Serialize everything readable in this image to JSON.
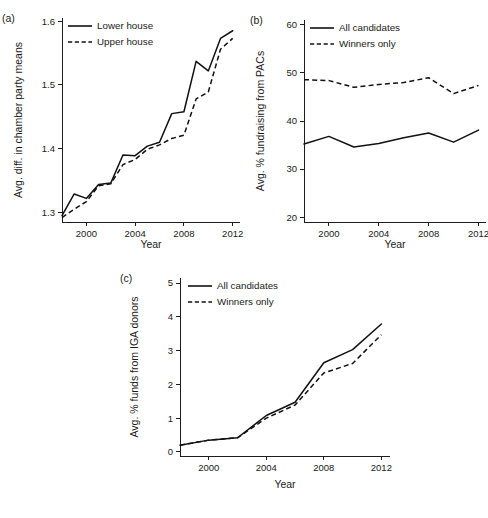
{
  "figure": {
    "background": "#ffffff",
    "line_color": "#111111",
    "axis_color": "#1d1d1d"
  },
  "chart_data": [
    {
      "type": "line",
      "panel": "(a)",
      "title": "",
      "xlabel": "Year",
      "ylabel": "Avg. diff. in chamber party means",
      "xlim": [
        1998,
        2012.6
      ],
      "ylim": [
        1.285,
        1.605
      ],
      "xticks": [
        2000,
        2004,
        2008,
        2012
      ],
      "yticks": [
        1.3,
        1.4,
        1.5,
        1.6
      ],
      "xticklabels": [
        "2000",
        "2004",
        "2008",
        "2012"
      ],
      "yticklabels": [
        "1.3",
        "1.4",
        "1.5",
        "1.6"
      ],
      "grid": false,
      "legend_position": "top-left",
      "x": [
        1998,
        1999,
        2000,
        2001,
        2002,
        2003,
        2004,
        2005,
        2006,
        2007,
        2008,
        2009,
        2010,
        2011,
        2012
      ],
      "series": [
        {
          "name": "Lower house",
          "style": "solid",
          "values": [
            1.295,
            1.329,
            1.322,
            1.344,
            1.346,
            1.39,
            1.389,
            1.404,
            1.41,
            1.455,
            1.458,
            1.537,
            1.522,
            1.573,
            1.585
          ]
        },
        {
          "name": "Upper house",
          "style": "dashed",
          "values": [
            1.292,
            1.305,
            1.317,
            1.342,
            1.345,
            1.375,
            1.383,
            1.399,
            1.406,
            1.416,
            1.421,
            1.478,
            1.489,
            1.556,
            1.573
          ]
        }
      ]
    },
    {
      "type": "line",
      "panel": "(b)",
      "title": "",
      "xlabel": "Year",
      "ylabel": "Avg. % fundraising from PACs",
      "xlim": [
        1998,
        2012.6
      ],
      "ylim": [
        19,
        61
      ],
      "xticks": [
        2000,
        2004,
        2008,
        2012
      ],
      "yticks": [
        20,
        30,
        40,
        50,
        60
      ],
      "xticklabels": [
        "2000",
        "2004",
        "2008",
        "2012"
      ],
      "yticklabels": [
        "20",
        "30",
        "40",
        "50",
        "60"
      ],
      "grid": false,
      "legend_position": "top-left",
      "x": [
        1998,
        2000,
        2002,
        2004,
        2006,
        2008,
        2010,
        2012
      ],
      "series": [
        {
          "name": "All candidates",
          "style": "solid",
          "values": [
            35.2,
            36.8,
            34.6,
            35.3,
            36.5,
            37.5,
            35.6,
            38.1
          ]
        },
        {
          "name": "Winners only",
          "style": "dashed",
          "values": [
            48.6,
            48.4,
            47.0,
            47.6,
            48.0,
            49.0,
            45.7,
            47.4
          ]
        }
      ]
    },
    {
      "type": "line",
      "panel": "(c)",
      "title": "",
      "xlabel": "Year",
      "ylabel": "Avg. % funds from IGA donors",
      "xlim": [
        1998,
        2012.6
      ],
      "ylim": [
        -0.12,
        5.15
      ],
      "xticks": [
        2000,
        2004,
        2008,
        2012
      ],
      "yticks": [
        0,
        1,
        2,
        3,
        4,
        5
      ],
      "xticklabels": [
        "2000",
        "2004",
        "2008",
        "2012"
      ],
      "yticklabels": [
        "0",
        "1",
        "2",
        "3",
        "4",
        "5"
      ],
      "grid": false,
      "legend_position": "top-left",
      "x": [
        1998,
        2000,
        2002,
        2004,
        2006,
        2008,
        2010,
        2012
      ],
      "series": [
        {
          "name": "All candidates",
          "style": "solid",
          "values": [
            0.2,
            0.35,
            0.42,
            1.08,
            1.47,
            2.64,
            3.03,
            3.79
          ]
        },
        {
          "name": "Winners only",
          "style": "dashed",
          "values": [
            0.2,
            0.35,
            0.42,
            1.0,
            1.39,
            2.34,
            2.62,
            3.47
          ]
        }
      ]
    }
  ]
}
